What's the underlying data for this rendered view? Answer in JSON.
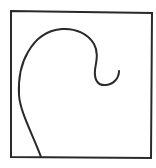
{
  "figure": {
    "stroke_color": "#2a2a2a",
    "background_color": "#ffffff",
    "frame": {
      "x1": 11,
      "y1": 11,
      "x2": 152,
      "y2": 158
    },
    "curve_path": "M41 157 C33 135 20 112 19 95 C18 75 22 62 28 52 C36 38 48 30 62 29 C76 28 88 34 94 44 C99 53 96 62 95 70 C94 80 98 86 106 85 C114 84 119 78 119 71"
  }
}
